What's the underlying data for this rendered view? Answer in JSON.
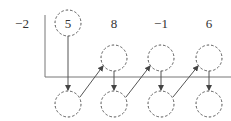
{
  "diagram": {
    "divisor": "−2",
    "coefficients": [
      "5",
      "8",
      "−1",
      "6"
    ],
    "colors": {
      "stroke": "#555555",
      "line": "#777777",
      "text": "#333333"
    }
  }
}
